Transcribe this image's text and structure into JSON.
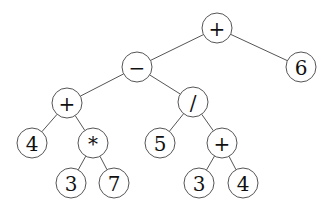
{
  "diagram": {
    "type": "expression-tree",
    "expression": "((4 + 3 * 7) - (5 / (3 + 4))) + 6",
    "node_radius": 15,
    "colors": {
      "stroke": "#555555",
      "text": "#111111",
      "background": "#ffffff"
    },
    "nodes": [
      {
        "id": "n0",
        "label": "+",
        "x": 217,
        "y": 28
      },
      {
        "id": "n1",
        "label": "−",
        "x": 137,
        "y": 67
      },
      {
        "id": "n2",
        "label": "6",
        "x": 301,
        "y": 67
      },
      {
        "id": "n3",
        "label": "+",
        "x": 67,
        "y": 103
      },
      {
        "id": "n4",
        "label": "/",
        "x": 193,
        "y": 102
      },
      {
        "id": "n5",
        "label": "4",
        "x": 32,
        "y": 143
      },
      {
        "id": "n6",
        "label": "*",
        "x": 93,
        "y": 143
      },
      {
        "id": "n7",
        "label": "5",
        "x": 160,
        "y": 143
      },
      {
        "id": "n8",
        "label": "+",
        "x": 222,
        "y": 143
      },
      {
        "id": "n9",
        "label": "3",
        "x": 71,
        "y": 183
      },
      {
        "id": "n10",
        "label": "7",
        "x": 114,
        "y": 183
      },
      {
        "id": "n11",
        "label": "3",
        "x": 199,
        "y": 183
      },
      {
        "id": "n12",
        "label": "4",
        "x": 243,
        "y": 183
      }
    ],
    "edges": [
      [
        "n0",
        "n1"
      ],
      [
        "n0",
        "n2"
      ],
      [
        "n1",
        "n3"
      ],
      [
        "n1",
        "n4"
      ],
      [
        "n3",
        "n5"
      ],
      [
        "n3",
        "n6"
      ],
      [
        "n4",
        "n7"
      ],
      [
        "n4",
        "n8"
      ],
      [
        "n6",
        "n9"
      ],
      [
        "n6",
        "n10"
      ],
      [
        "n8",
        "n11"
      ],
      [
        "n8",
        "n12"
      ]
    ]
  }
}
